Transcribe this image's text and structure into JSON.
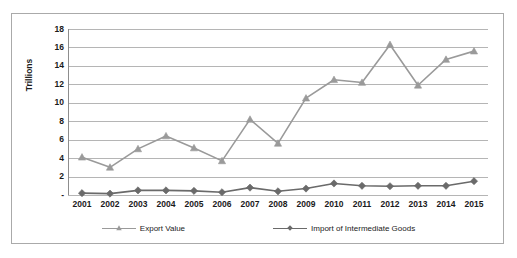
{
  "chart_data": {
    "type": "line",
    "title": "",
    "xlabel": "",
    "ylabel": "Trillions",
    "ylim": [
      0,
      18
    ],
    "ytick_values": [
      0,
      2,
      4,
      6,
      8,
      10,
      12,
      14,
      16,
      18
    ],
    "ytick_labels": [
      "-",
      "2",
      "4",
      "6",
      "8",
      "10",
      "12",
      "14",
      "16",
      "18"
    ],
    "grid": true,
    "legend_position": "bottom",
    "categories": [
      "2001",
      "2002",
      "2003",
      "2004",
      "2005",
      "2006",
      "2007",
      "2008",
      "2009",
      "2010",
      "2011",
      "2012",
      "2013",
      "2014",
      "2015"
    ],
    "series": [
      {
        "name": "Export Value",
        "marker": "triangle",
        "color": "#9a9a9a",
        "values": [
          4.1,
          3.0,
          5.0,
          6.4,
          5.1,
          3.7,
          8.2,
          5.6,
          10.5,
          12.5,
          12.2,
          16.3,
          11.9,
          14.7,
          15.6
        ]
      },
      {
        "name": "Import of Intermediate Goods",
        "marker": "diamond",
        "color": "#6a6a6a",
        "values": [
          0.2,
          0.15,
          0.5,
          0.5,
          0.45,
          0.3,
          0.8,
          0.4,
          0.7,
          1.25,
          1.0,
          0.95,
          1.0,
          1.0,
          1.5
        ]
      }
    ]
  },
  "axis": {
    "y_title": "Trillions"
  },
  "colors": {
    "export_series": "#9a9a9a",
    "import_series": "#6a6a6a",
    "gridline": "#b5b5b5",
    "frame": "#aaaaaa"
  }
}
